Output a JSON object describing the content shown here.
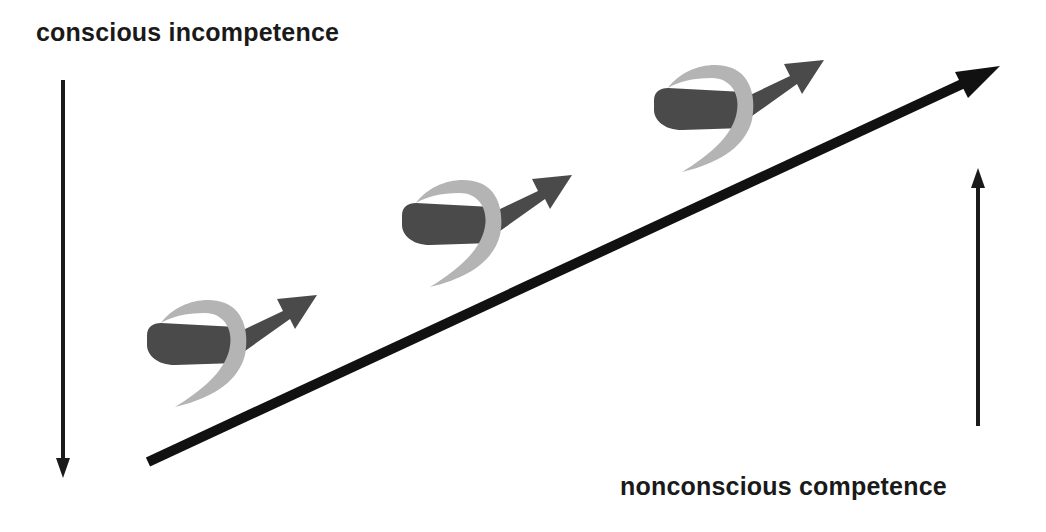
{
  "diagram": {
    "labels": {
      "top_left": "conscious incompetence",
      "bottom_right": "nonconscious competence"
    },
    "colors": {
      "background": "#ffffff",
      "text": "#1a1a1a",
      "main_arrow": "#111111",
      "side_arrows": "#1a1a1a",
      "ribbon_dark": "#4a4a4a",
      "ribbon_light": "#b4b4b4",
      "swirl_arrow": "#4a4a4a"
    },
    "arrows": {
      "main": {
        "direction": "up-right",
        "from": [
          148,
          462
        ],
        "to": [
          1000,
          66
        ]
      },
      "left": {
        "direction": "down",
        "from": [
          63,
          80
        ],
        "to": [
          63,
          476
        ]
      },
      "right": {
        "direction": "up",
        "from": [
          978,
          426
        ],
        "to": [
          978,
          170
        ]
      }
    },
    "swirl_icons": [
      {
        "name": "swirl-step-1",
        "x": 145,
        "y": 293
      },
      {
        "name": "swirl-step-2",
        "x": 400,
        "y": 173
      },
      {
        "name": "swirl-step-3",
        "x": 652,
        "y": 58
      }
    ]
  }
}
